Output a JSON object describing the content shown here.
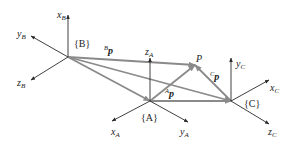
{
  "frames": {
    "B": {
      "label": "{B}",
      "origin": [
        68,
        57
      ],
      "axes": [
        {
          "name": "x",
          "sub": "B",
          "tip": [
            68,
            15
          ],
          "label_pos": [
            57,
            18
          ]
        },
        {
          "name": "y",
          "sub": "B",
          "tip": [
            31,
            36
          ],
          "label_pos": [
            17,
            37
          ]
        },
        {
          "name": "z",
          "sub": "B",
          "tip": [
            31,
            80
          ],
          "label_pos": [
            17,
            86
          ]
        }
      ]
    },
    "A": {
      "label": "{A}",
      "origin": [
        150,
        101
      ],
      "axes": [
        {
          "name": "z",
          "sub": "A",
          "tip": [
            150,
            58
          ],
          "label_pos": [
            145,
            55
          ]
        },
        {
          "name": "x",
          "sub": "A",
          "tip": [
            112,
            121
          ],
          "label_pos": [
            111,
            135
          ]
        },
        {
          "name": "y",
          "sub": "A",
          "tip": [
            188,
            122
          ],
          "label_pos": [
            180,
            135
          ]
        }
      ]
    },
    "C": {
      "label": "{C}",
      "origin": [
        231,
        101
      ],
      "axes": [
        {
          "name": "y",
          "sub": "C",
          "tip": [
            231,
            58
          ],
          "label_pos": [
            236,
            67
          ]
        },
        {
          "name": "x",
          "sub": "C",
          "tip": [
            269,
            80
          ],
          "label_pos": [
            270,
            91
          ]
        },
        {
          "name": "z",
          "sub": "C",
          "tip": [
            269,
            124
          ],
          "label_pos": [
            268,
            135
          ]
        }
      ]
    }
  },
  "point": {
    "label": "P",
    "pos": [
      195,
      65
    ],
    "label_pos": [
      196,
      62
    ]
  },
  "vectors": [
    {
      "label": "p",
      "sup": "B",
      "from": [
        68,
        57
      ],
      "to": [
        195,
        65
      ],
      "label_pos": [
        104,
        54
      ]
    },
    {
      "label": "p",
      "sup": "A",
      "from": [
        150,
        101
      ],
      "to": [
        195,
        65
      ],
      "label_pos": [
        165,
        97
      ]
    },
    {
      "label": "p",
      "sup": "C",
      "from": [
        231,
        101
      ],
      "to": [
        195,
        65
      ],
      "label_pos": [
        210,
        80
      ]
    }
  ],
  "connectors": [
    {
      "from": [
        68,
        57
      ],
      "to": [
        150,
        101
      ]
    },
    {
      "from": [
        68,
        57
      ],
      "to": [
        231,
        101
      ]
    },
    {
      "from": [
        150,
        101
      ],
      "to": [
        231,
        101
      ]
    }
  ],
  "frame_labels": [
    {
      "text": "{B}",
      "pos": [
        74,
        47
      ]
    },
    {
      "text": "{A}",
      "pos": [
        141,
        121
      ]
    },
    {
      "text": "{C}",
      "pos": [
        244,
        107
      ]
    }
  ],
  "colors": {
    "axis": "#2a2a2a",
    "vector": "#8a8a8a",
    "text": "#222222"
  }
}
